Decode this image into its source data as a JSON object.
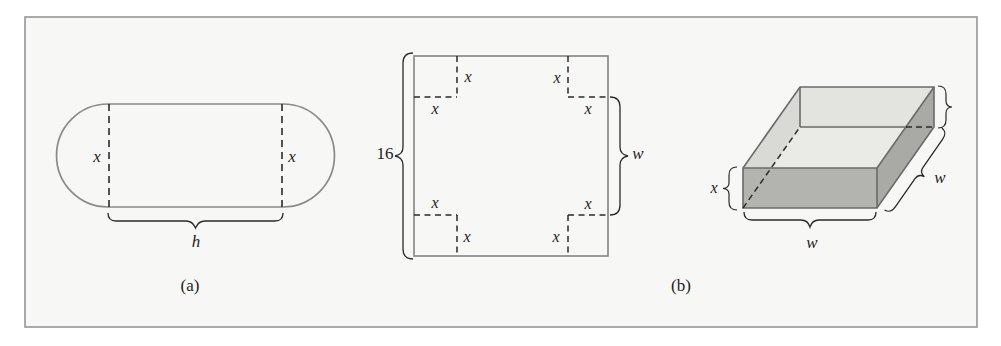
{
  "figure": {
    "panel_a": {
      "caption": "(a)",
      "stadium": {
        "left_dashed_label": "x",
        "right_dashed_label": "x",
        "bottom_brace_label": "h"
      }
    },
    "panel_b": {
      "caption": "(b)",
      "flat_sheet": {
        "side_length_label": "16",
        "right_brace_label": "w",
        "corner_cut_labels": [
          "x",
          "x",
          "x",
          "x",
          "x",
          "x",
          "x",
          "x"
        ]
      },
      "open_box": {
        "height_brace_label": "x",
        "front_width_brace_label": "w",
        "depth_brace_label": "w"
      }
    },
    "colors": {
      "panel_background": "#f7f7f5",
      "panel_border": "#8f8f8f",
      "shape_outline_gray": "#8a8a8a",
      "box_edge_gray": "#6a6a6a",
      "dashed_line": "#2a2a2a",
      "box_interior_bottom": "#eaeae7",
      "box_interior_back_wall": "#e3e3e0",
      "box_interior_left_wall": "#d9d9d6",
      "box_right_face": "#a9a9a6",
      "box_front_face": "#b3b3b0"
    }
  }
}
